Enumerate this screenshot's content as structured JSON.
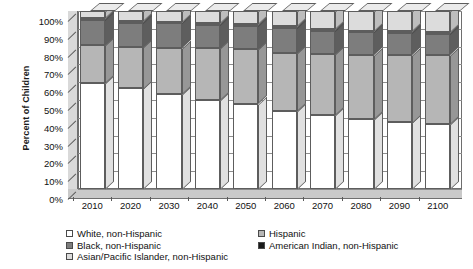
{
  "chart_data": {
    "type": "bar",
    "stacked": true,
    "title": "",
    "xlabel": "",
    "ylabel": "Percent of Children",
    "ylim": [
      0,
      100
    ],
    "ytick_labels": [
      "0%",
      "10%",
      "20%",
      "30%",
      "40%",
      "50%",
      "60%",
      "70%",
      "80%",
      "90%",
      "100%"
    ],
    "ytick_values": [
      0,
      10,
      20,
      30,
      40,
      50,
      60,
      70,
      80,
      90,
      100
    ],
    "grid": true,
    "legend_position": "bottom",
    "categories": [
      "2010",
      "2020",
      "2030",
      "2040",
      "2050",
      "2060",
      "2070",
      "2080",
      "2090",
      "2100"
    ],
    "series": [
      {
        "name": "White, non-Hispanic",
        "color": "#ffffff",
        "values": [
          59.5,
          56.5,
          53.5,
          50.0,
          48.0,
          44.0,
          41.5,
          39.5,
          37.5,
          36.5
        ]
      },
      {
        "name": "Hispanic",
        "color": "#b6b6b6",
        "values": [
          21.5,
          23.5,
          26.0,
          29.0,
          30.5,
          32.5,
          34.5,
          36.0,
          38.0,
          39.0
        ]
      },
      {
        "name": "Black, non-Hispanic",
        "color": "#7d7d7d",
        "values": [
          14.0,
          13.5,
          13.5,
          13.0,
          13.0,
          14.0,
          13.0,
          12.5,
          12.0,
          11.5
        ]
      },
      {
        "name": "American Indian, non-Hispanic",
        "color": "#1a1a1a",
        "values": [
          1.0,
          1.0,
          1.0,
          1.0,
          1.0,
          1.0,
          1.0,
          1.0,
          1.0,
          1.0
        ]
      },
      {
        "name": "Asian/Pacific Islander, non-Hispanic",
        "color": "#dcdcdc",
        "values": [
          4.0,
          5.5,
          6.0,
          7.0,
          7.5,
          8.5,
          10.0,
          11.0,
          11.5,
          12.0
        ]
      }
    ]
  },
  "legend": {
    "columns": [
      [
        {
          "label": "White, non-Hispanic",
          "swatch": "white-swatch",
          "color": "#ffffff"
        },
        {
          "label": "Black, non-Hispanic",
          "swatch": "black-nonhispanic-swatch",
          "color": "#7d7d7d"
        },
        {
          "label": "Asian/Pacific Islander, non-Hispanic",
          "swatch": "asian-pacific-islander-swatch",
          "color": "#dcdcdc"
        }
      ],
      [
        {
          "label": "Hispanic",
          "swatch": "hispanic-swatch",
          "color": "#b6b6b6"
        },
        {
          "label": "American Indian, non-Hispanic",
          "swatch": "american-indian-swatch",
          "color": "#1a1a1a"
        }
      ]
    ]
  }
}
